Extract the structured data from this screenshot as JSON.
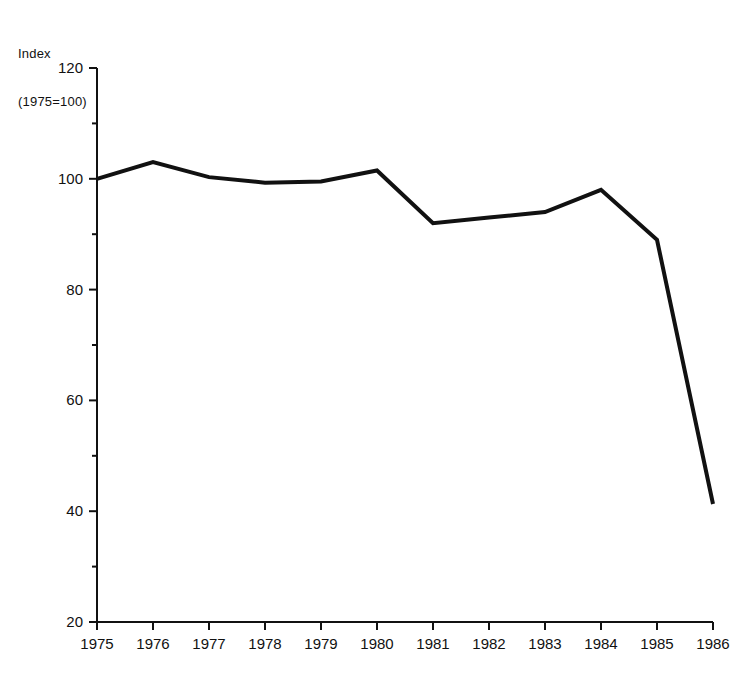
{
  "header": {
    "line1": "Index",
    "line2": "(1975=100)"
  },
  "chart_data": {
    "type": "line",
    "title": "",
    "subtitle": "",
    "xlabel": "",
    "ylabel": "Index (1975=100)",
    "categories": [
      "1975",
      "1976",
      "1977",
      "1978",
      "1979",
      "1980",
      "1981",
      "1982",
      "1983",
      "1984",
      "1985",
      "1986"
    ],
    "x": [
      1975,
      1976,
      1977,
      1978,
      1979,
      1980,
      1981,
      1982,
      1983,
      1984,
      1985,
      1986
    ],
    "values": [
      100.0,
      103.0,
      100.3,
      99.3,
      99.5,
      101.5,
      92.0,
      93.0,
      94.0,
      98.0,
      89.0,
      41.3
    ],
    "series": [
      {
        "name": "Index (1975=100)",
        "values": [
          100.0,
          103.0,
          100.3,
          99.3,
          99.5,
          101.5,
          92.0,
          93.0,
          94.0,
          98.0,
          89.0,
          41.3
        ]
      }
    ],
    "ylim": [
      20,
      120
    ],
    "xlim": [
      1975,
      1986
    ],
    "y_major_ticks": [
      20,
      40,
      60,
      80,
      100,
      120
    ],
    "y_minor_ticks": [
      30,
      50,
      70,
      90,
      110
    ],
    "y_tick_labels": [
      "20",
      "40",
      "60",
      "80",
      "100",
      "120"
    ],
    "x_tick_labels": [
      "1975",
      "1976",
      "1977",
      "1978",
      "1979",
      "1980",
      "1981",
      "1982",
      "1983",
      "1984",
      "1985",
      "1986"
    ],
    "grid": false,
    "legend": false,
    "legend_position": "none",
    "line_color": "#111111",
    "line_width": 4,
    "axis_color": "#111111",
    "background": "#ffffff"
  }
}
